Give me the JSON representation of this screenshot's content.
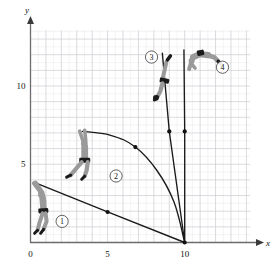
{
  "figure": {
    "type": "physics-trajectory-diagram",
    "background": "#ffffff"
  },
  "axes": {
    "x_label": "x",
    "y_label": "y",
    "x_ticks": [
      {
        "value": 0,
        "label": "0"
      },
      {
        "value": 5,
        "label": "5"
      },
      {
        "value": 10,
        "label": "10"
      }
    ],
    "y_ticks": [
      {
        "value": 5,
        "label": "5"
      },
      {
        "value": 10,
        "label": "10"
      }
    ],
    "xlim": [
      0,
      14.2
    ],
    "ylim": [
      0,
      13.6
    ],
    "grid": true,
    "major_grid_step": 1,
    "minor_grid_step": 0.5,
    "grid_major_color": "#cfcfd4",
    "grid_minor_color": "#e9e9ee",
    "axis_color": "#6b6b70"
  },
  "chart_data": {
    "type": "line",
    "title": "",
    "xlabel": "x",
    "ylabel": "y",
    "xlim": [
      0,
      14.2
    ],
    "ylim": [
      0,
      13.6
    ],
    "grid": true,
    "pivot": {
      "x": 10,
      "y": 0
    },
    "series": [
      {
        "name": "trajectory-1",
        "kind": "straight",
        "points": [
          [
            0.2,
            3.85
          ],
          [
            5.0,
            1.95
          ],
          [
            10.0,
            0.0
          ]
        ],
        "midpoint": [
          5.0,
          1.95
        ],
        "color": "#1a1a1a"
      },
      {
        "name": "trajectory-2",
        "kind": "curved",
        "points": [
          [
            3.35,
            7.1
          ],
          [
            5.2,
            6.85
          ],
          [
            6.8,
            6.1
          ],
          [
            8.2,
            4.6
          ],
          [
            9.3,
            2.6
          ],
          [
            10.0,
            0.0
          ]
        ],
        "midpoint": [
          6.8,
          6.1
        ],
        "color": "#1a1a1a"
      },
      {
        "name": "trajectory-3",
        "kind": "straight",
        "points": [
          [
            8.55,
            12.1
          ],
          [
            9.0,
            7.1
          ],
          [
            10.0,
            0.0
          ]
        ],
        "midpoint": [
          9.0,
          7.1
        ],
        "color": "#1a1a1a"
      },
      {
        "name": "trajectory-4",
        "kind": "straight",
        "points": [
          [
            9.95,
            12.3
          ],
          [
            10.0,
            7.1
          ],
          [
            10.0,
            0.0
          ]
        ],
        "midpoint": [
          10.0,
          7.1
        ],
        "color": "#1a1a1a"
      }
    ],
    "markers": [
      {
        "name": "pivot-dot",
        "x": 10.0,
        "y": 0.0
      },
      {
        "name": "midpoint-dot-1",
        "x": 5.0,
        "y": 1.95
      },
      {
        "name": "midpoint-dot-2",
        "x": 6.8,
        "y": 6.1
      },
      {
        "name": "midpoint-dot-3",
        "x": 9.0,
        "y": 7.1
      },
      {
        "name": "midpoint-dot-4",
        "x": 10.0,
        "y": 7.1
      }
    ]
  },
  "figures": [
    {
      "id": 1,
      "label": "1",
      "pose": "upright-hanging",
      "position": {
        "x": 0.75,
        "y": 2.1
      },
      "body_color": "#9a9a9a",
      "shorts_color": "#1a1a1a"
    },
    {
      "id": 2,
      "label": "2",
      "pose": "swinging-legs-forward",
      "position": {
        "x": 3.4,
        "y": 5.4
      },
      "body_color": "#9a9a9a",
      "shorts_color": "#1a1a1a"
    },
    {
      "id": 3,
      "label": "3",
      "pose": "inverted-vertical",
      "position": {
        "x": 8.6,
        "y": 10.3
      },
      "body_color": "#9a9a9a",
      "shorts_color": "#1a1a1a"
    },
    {
      "id": 4,
      "label": "4",
      "pose": "inverted-arched-horizontal",
      "position": {
        "x": 11.2,
        "y": 12.0
      },
      "body_color": "#9a9a9a",
      "shorts_color": "#1a1a1a"
    }
  ],
  "callouts": [
    {
      "name": "callout-1",
      "label": "1",
      "x": 2.05,
      "y": 1.35
    },
    {
      "name": "callout-2",
      "label": "2",
      "x": 5.55,
      "y": 4.25
    },
    {
      "name": "callout-3",
      "label": "3",
      "x": 7.85,
      "y": 11.85
    },
    {
      "name": "callout-4",
      "label": "4",
      "x": 12.45,
      "y": 11.2
    }
  ]
}
